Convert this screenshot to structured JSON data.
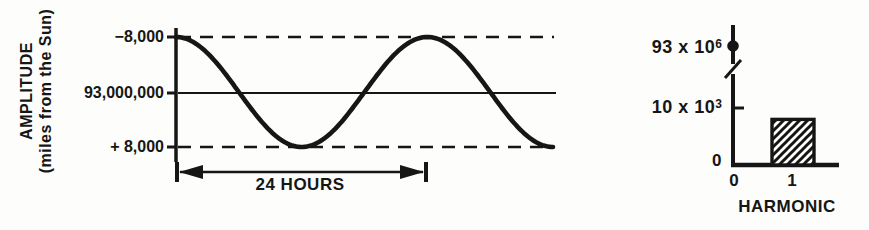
{
  "figure": {
    "ink": "#161616",
    "background": "#fdfdfb"
  },
  "left_chart": {
    "ylabel_line1": "AMPLITUDE",
    "ylabel_line2": "(miles from the Sun)",
    "ytick_top": "−8,000",
    "ytick_mid": "93,000,000",
    "ytick_bottom": "+ 8,000",
    "period_label": "24 HOURS"
  },
  "right_chart": {
    "ytick_top_base": "93 x 10",
    "ytick_top_exp": "6",
    "ytick_mid_base": "10 x 10",
    "ytick_mid_exp": "3",
    "ytick_zero": "0",
    "xtick_0": "0",
    "xtick_1": "1",
    "xlabel": "HARMONIC"
  },
  "chart_data": [
    {
      "type": "line",
      "waveform": "sinusoid",
      "ylabel": "AMPLITUDE (miles from the Sun)",
      "y_tick_labels": [
        "-8,000",
        "93,000,000",
        "+ 8,000"
      ],
      "mean_miles": 93000000,
      "amplitude_miles": 8000,
      "period_label": "24 HOURS",
      "period_hours": 24,
      "cycles_shown": 1.5,
      "starts_at": "top (-8,000 level)",
      "reference_lines": [
        "dashed at -8,000",
        "solid at 93,000,000",
        "dashed at + 8,000"
      ],
      "grid": false
    },
    {
      "type": "bar",
      "xlabel": "HARMONIC",
      "categories": [
        "0",
        "1"
      ],
      "values": [
        93000000,
        8000
      ],
      "y_tick_labels": [
        "93 x 10^6",
        "10 x 10^3",
        "0"
      ],
      "ytick_mid_value": 10000,
      "axis_break": true,
      "harmonic_0_marker": "filled dot on axis at 93 x 10^6",
      "bar_style": "diagonal-hatch",
      "grid": false
    }
  ]
}
